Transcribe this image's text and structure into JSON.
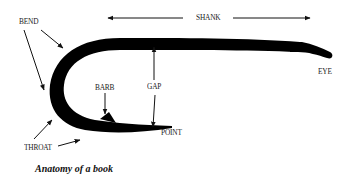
{
  "diagram": {
    "title": "Anatomy of a book",
    "colors": {
      "hook": "#000000",
      "arrows": "#111111",
      "text": "#222222",
      "background": "#ffffff"
    },
    "labels": {
      "bend": "BEND",
      "shank": "SHANK",
      "eye": "EYE",
      "gap": "GAP",
      "barb": "BARB",
      "point": "POINT",
      "throat": "THROAT"
    },
    "parts": [
      {
        "id": "bend",
        "label": "BEND",
        "arrows": 2
      },
      {
        "id": "shank",
        "label": "SHANK",
        "arrows": 2,
        "direction": "double-horizontal"
      },
      {
        "id": "eye",
        "label": "EYE",
        "arrows": 0
      },
      {
        "id": "gap",
        "label": "GAP",
        "arrows": 2,
        "direction": "double-vertical"
      },
      {
        "id": "barb",
        "label": "BARB",
        "arrows": 1
      },
      {
        "id": "point",
        "label": "POINT",
        "arrows": 0
      },
      {
        "id": "throat",
        "label": "THROAT",
        "arrows": 2
      }
    ]
  }
}
